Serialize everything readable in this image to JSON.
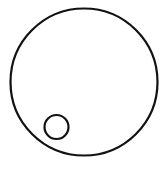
{
  "diagram": {
    "background": "#ffffff",
    "stroke_color": "#111111",
    "shapes": [
      {
        "name": "outer-circle",
        "type": "circle",
        "cx": 84,
        "cy": 82,
        "r": 73.5,
        "stroke_width": 2.2,
        "fill": "none"
      },
      {
        "name": "inner-circle",
        "type": "circle",
        "cx": 56.5,
        "cy": 127,
        "r": 12,
        "stroke_width": 2.2,
        "fill": "none"
      }
    ]
  }
}
